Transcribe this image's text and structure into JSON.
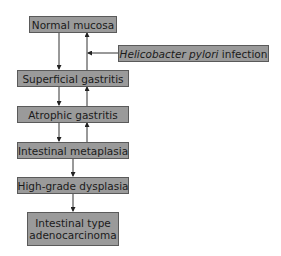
{
  "diagram": {
    "nodes": [
      {
        "id": "normal",
        "label": "Normal mucosa"
      },
      {
        "id": "hpylori",
        "label_italic": "Helicobacter pylori",
        "label_rest": " infection"
      },
      {
        "id": "superficial",
        "label": "Superficial gastritis"
      },
      {
        "id": "atrophic",
        "label": "Atrophic gastritis"
      },
      {
        "id": "metaplasia",
        "label": "Intestinal metaplasia"
      },
      {
        "id": "dysplasia",
        "label": "High-grade dysplasia"
      },
      {
        "id": "adeno",
        "label_line1": "Intestinal type",
        "label_line2": "adenocarcinoma"
      }
    ],
    "edges": [
      {
        "from": "normal",
        "to": "superficial",
        "direction": "down"
      },
      {
        "from": "superficial",
        "to": "normal",
        "direction": "up"
      },
      {
        "from": "hpylori",
        "to": "superficial-normal-link",
        "direction": "left"
      },
      {
        "from": "superficial",
        "to": "atrophic",
        "direction": "down"
      },
      {
        "from": "atrophic",
        "to": "superficial",
        "direction": "up"
      },
      {
        "from": "atrophic",
        "to": "metaplasia",
        "direction": "down"
      },
      {
        "from": "metaplasia",
        "to": "atrophic",
        "direction": "up"
      },
      {
        "from": "metaplasia",
        "to": "dysplasia",
        "direction": "down"
      },
      {
        "from": "dysplasia",
        "to": "adeno",
        "direction": "down"
      }
    ],
    "colors": {
      "box_fill": "#9a9a9a",
      "box_border": "#5a5a5a",
      "line": "#333333"
    }
  }
}
